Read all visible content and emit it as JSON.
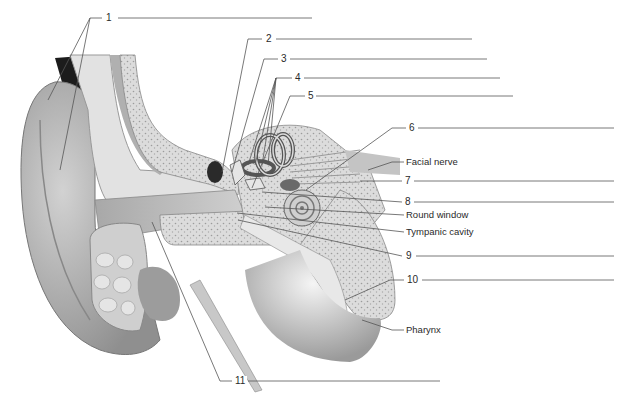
{
  "diagram": {
    "numbered_labels": [
      {
        "id": 1,
        "text": "1",
        "answer": ""
      },
      {
        "id": 2,
        "text": "2",
        "answer": ""
      },
      {
        "id": 3,
        "text": "3",
        "answer": ""
      },
      {
        "id": 4,
        "text": "4",
        "answer": ""
      },
      {
        "id": 5,
        "text": "5",
        "answer": ""
      },
      {
        "id": 6,
        "text": "6",
        "answer": ""
      },
      {
        "id": 7,
        "text": "7",
        "answer": ""
      },
      {
        "id": 8,
        "text": "8",
        "answer": ""
      },
      {
        "id": 9,
        "text": "9",
        "answer": ""
      },
      {
        "id": 10,
        "text": "10",
        "answer": ""
      },
      {
        "id": 11,
        "text": "11",
        "answer": ""
      }
    ],
    "named_labels": {
      "facial_nerve": "Facial nerve",
      "round_window": "Round window",
      "tympanic_cavity": "Tympanic cavity",
      "pharynx": "Pharynx"
    },
    "colors": {
      "line": "#555555",
      "text": "#2a2a2a",
      "skin": "#b9b9b9",
      "bone": "#d8d8d8",
      "dark": "#3a3a3a"
    }
  }
}
